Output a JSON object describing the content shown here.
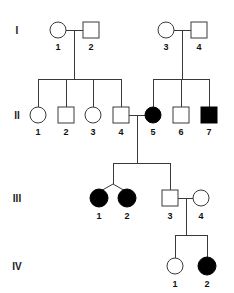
{
  "figure": {
    "type": "pedigree-chart",
    "title_fragment": "",
    "background_color": "#ffffff",
    "line_color": "#3a3a3a",
    "affected_color": "#000000",
    "unaffected_color": "#ffffff",
    "width": 234,
    "height": 293
  },
  "legend_semantics": {
    "circle": "female",
    "square": "male",
    "filled": "affected",
    "open": "unaffected",
    "twin_fork": "monozygotic-or-dizygotic twins"
  },
  "generations": [
    {
      "roman": "I",
      "y": 30,
      "label_y": 34,
      "individuals": [
        {
          "id": "I-1",
          "number": "1",
          "sex": "female",
          "shape": "circle",
          "affected": false,
          "x": 58,
          "y": 30
        },
        {
          "id": "I-2",
          "number": "2",
          "sex": "male",
          "shape": "square",
          "affected": false,
          "x": 91,
          "y": 30
        },
        {
          "id": "I-3",
          "number": "3",
          "sex": "female",
          "shape": "circle",
          "affected": false,
          "x": 166,
          "y": 30
        },
        {
          "id": "I-4",
          "number": "4",
          "sex": "male",
          "shape": "square",
          "affected": false,
          "x": 199,
          "y": 30
        }
      ]
    },
    {
      "roman": "II",
      "y": 115,
      "label_y": 119,
      "individuals": [
        {
          "id": "II-1",
          "number": "1",
          "sex": "female",
          "shape": "circle",
          "affected": false,
          "x": 38,
          "y": 115
        },
        {
          "id": "II-2",
          "number": "2",
          "sex": "male",
          "shape": "square",
          "affected": false,
          "x": 66,
          "y": 115
        },
        {
          "id": "II-3",
          "number": "3",
          "sex": "female",
          "shape": "circle",
          "affected": false,
          "x": 93,
          "y": 115
        },
        {
          "id": "II-4",
          "number": "4",
          "sex": "male",
          "shape": "square",
          "affected": false,
          "x": 121,
          "y": 115
        },
        {
          "id": "II-5",
          "number": "5",
          "sex": "female",
          "shape": "circle",
          "affected": true,
          "x": 153,
          "y": 115
        },
        {
          "id": "II-6",
          "number": "6",
          "sex": "male",
          "shape": "square",
          "affected": false,
          "x": 181,
          "y": 115
        },
        {
          "id": "II-7",
          "number": "7",
          "sex": "male",
          "shape": "square",
          "affected": true,
          "x": 209,
          "y": 115
        }
      ]
    },
    {
      "roman": "III",
      "y": 198,
      "label_y": 202,
      "individuals": [
        {
          "id": "III-1",
          "number": "1",
          "sex": "female",
          "shape": "circle",
          "affected": true,
          "x": 99,
          "y": 198
        },
        {
          "id": "III-2",
          "number": "2",
          "sex": "female",
          "shape": "circle",
          "affected": true,
          "x": 127,
          "y": 198
        },
        {
          "id": "III-3",
          "number": "3",
          "sex": "male",
          "shape": "square",
          "affected": false,
          "x": 170,
          "y": 198
        },
        {
          "id": "III-4",
          "number": "4",
          "sex": "female",
          "shape": "circle",
          "affected": false,
          "x": 201,
          "y": 198
        }
      ]
    },
    {
      "roman": "IV",
      "y": 266,
      "label_y": 270,
      "individuals": [
        {
          "id": "IV-1",
          "number": "1",
          "sex": "female",
          "shape": "circle",
          "affected": false,
          "x": 175,
          "y": 266
        },
        {
          "id": "IV-2",
          "number": "2",
          "sex": "female",
          "shape": "circle",
          "affected": true,
          "x": 207,
          "y": 266
        }
      ]
    }
  ],
  "matings": [
    {
      "id": "mating-I-1-I-2",
      "partners": [
        "I-1",
        "I-2"
      ],
      "children": [
        "II-1",
        "II-2",
        "II-3",
        "II-4"
      ]
    },
    {
      "id": "mating-I-3-I-4",
      "partners": [
        "I-3",
        "I-4"
      ],
      "children": [
        "II-5",
        "II-6",
        "II-7"
      ]
    },
    {
      "id": "mating-II-4-II-5",
      "partners": [
        "II-4",
        "II-5"
      ],
      "children": [
        "III-1",
        "III-2",
        "III-3"
      ],
      "twins": [
        "III-1",
        "III-2"
      ]
    },
    {
      "id": "mating-III-3-III-4",
      "partners": [
        "III-3",
        "III-4"
      ],
      "children": [
        "IV-1",
        "IV-2"
      ]
    }
  ],
  "generation_labels": {
    "x": 17,
    "items": [
      {
        "roman": "I",
        "y": 34
      },
      {
        "roman": "II",
        "y": 119
      },
      {
        "roman": "III",
        "y": 202
      },
      {
        "roman": "IV",
        "y": 270
      }
    ]
  }
}
